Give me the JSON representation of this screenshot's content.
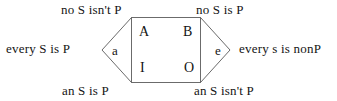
{
  "diagram": {
    "stroke_color": "#6b6b6b",
    "text_color": "#141414",
    "background": "#ffffff",
    "outer_labels": {
      "top_left": "no S isn't P",
      "top_right": "no S is P",
      "left": "every S is P",
      "right": "every s is nonP",
      "bottom_left": "an S is P",
      "bottom_right": "an S isn't P"
    },
    "corner_letters": {
      "top_left": "A",
      "top_right": "B",
      "bottom_left": "I",
      "bottom_right": "O"
    },
    "apex_letters": {
      "left": "a",
      "right": "e"
    }
  }
}
